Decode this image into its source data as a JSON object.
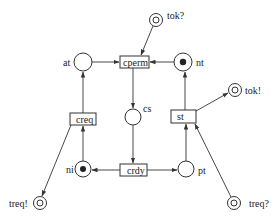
{
  "diagram": {
    "type": "petri-net",
    "places": [
      {
        "id": "tok_in",
        "label": "tok?",
        "kind": "interface",
        "tokens": 0
      },
      {
        "id": "at",
        "label": "at",
        "kind": "place",
        "tokens": 0
      },
      {
        "id": "nt",
        "label": "nt",
        "kind": "place",
        "tokens": 1
      },
      {
        "id": "tok_out",
        "label": "tok!",
        "kind": "interface",
        "tokens": 0
      },
      {
        "id": "cs",
        "label": "cs",
        "kind": "place",
        "tokens": 0
      },
      {
        "id": "ni",
        "label": "ni",
        "kind": "place",
        "tokens": 1
      },
      {
        "id": "pt",
        "label": "pt",
        "kind": "place",
        "tokens": 0
      },
      {
        "id": "treq_out",
        "label": "treq!",
        "kind": "interface",
        "tokens": 0
      },
      {
        "id": "treq_in",
        "label": "treq?",
        "kind": "interface",
        "tokens": 0
      }
    ],
    "transitions": [
      {
        "id": "cperm",
        "label": "cperm"
      },
      {
        "id": "creq",
        "label": "creq"
      },
      {
        "id": "st",
        "label": "st"
      },
      {
        "id": "crdy",
        "label": "crdy"
      }
    ],
    "arcs": [
      {
        "from": "tok?",
        "to": "cperm"
      },
      {
        "from": "at",
        "to": "cperm"
      },
      {
        "from": "nt",
        "to": "cperm"
      },
      {
        "from": "cperm",
        "to": "cs"
      },
      {
        "from": "cs",
        "to": "crdy"
      },
      {
        "from": "crdy",
        "to": "ni"
      },
      {
        "from": "crdy",
        "to": "pt"
      },
      {
        "from": "ni",
        "to": "creq"
      },
      {
        "from": "creq",
        "to": "at"
      },
      {
        "from": "creq",
        "to": "treq!"
      },
      {
        "from": "pt",
        "to": "st"
      },
      {
        "from": "treq?",
        "to": "st"
      },
      {
        "from": "st",
        "to": "nt"
      },
      {
        "from": "st",
        "to": "tok!"
      }
    ]
  }
}
